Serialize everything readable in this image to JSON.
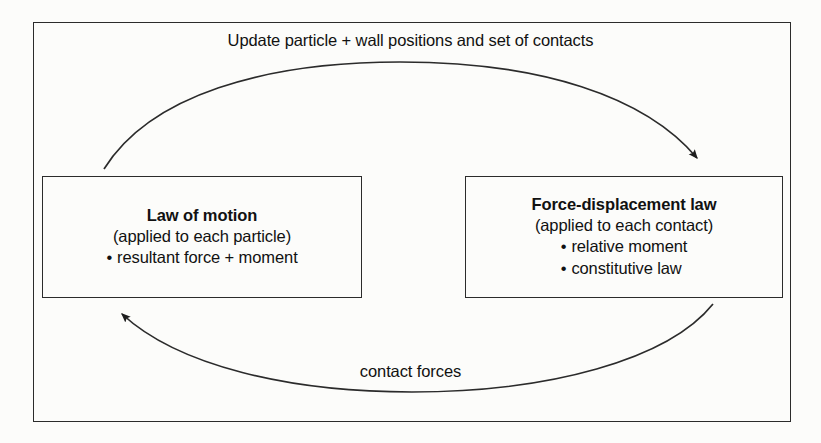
{
  "diagram": {
    "title_cycle_top": "Update particle + wall positions and set of contacts",
    "title_cycle_bottom": "contact forces",
    "boxes": [
      {
        "id": "law-of-motion",
        "title": "Law of motion",
        "subtitle": "(applied to each particle)",
        "bullets": [
          "resultant force + moment"
        ]
      },
      {
        "id": "force-displacement",
        "title": "Force-displacement law",
        "subtitle": "(applied to each contact)",
        "bullets": [
          "relative moment",
          "constitutive law"
        ]
      }
    ],
    "bullet_glyph": "•",
    "colors": {
      "stroke": "#2b2b2b",
      "text": "#111111",
      "background": "#fcfcfa"
    },
    "arrows": [
      {
        "id": "top-arrow",
        "from": "law-of-motion",
        "to": "force-displacement",
        "label": "Update particle + wall positions and set of contacts",
        "direction": "left-to-right"
      },
      {
        "id": "bottom-arrow",
        "from": "force-displacement",
        "to": "law-of-motion",
        "label": "contact forces",
        "direction": "right-to-left"
      }
    ]
  }
}
